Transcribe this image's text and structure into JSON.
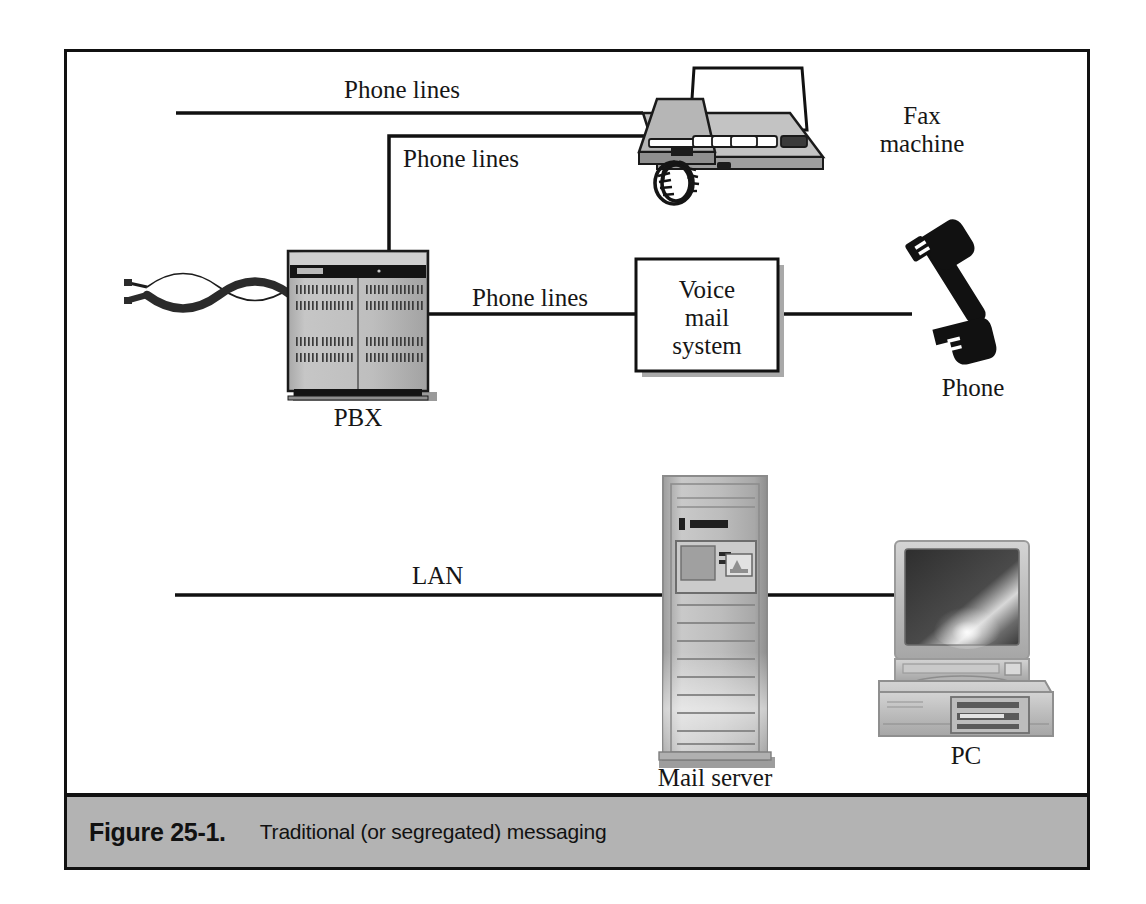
{
  "figure": {
    "number": "Figure 25-1.",
    "caption": "Traditional (or segregated) messaging",
    "bar_color": "#b3b3b3",
    "frame_color": "#111111"
  },
  "diagram": {
    "title_implicit": "Traditional (or segregated) messaging",
    "link_labels": {
      "phone_lines_top": "Phone lines",
      "phone_lines_pbx_fax": "Phone lines",
      "phone_lines_pbx_vm": "Phone lines",
      "lan": "LAN"
    },
    "nodes": [
      {
        "id": "fax",
        "label": "Fax\nmachine",
        "label_line1": "Fax",
        "label_line2": "machine",
        "icon": "fax-machine-icon"
      },
      {
        "id": "pbx",
        "label": "PBX",
        "icon": "pbx-cabinet-icon"
      },
      {
        "id": "voicemail",
        "label": "Voice mail system",
        "line1": "Voice",
        "line2": "mail",
        "line3": "system",
        "icon": "voice-mail-box"
      },
      {
        "id": "phone",
        "label": "Phone",
        "icon": "telephone-handset-icon"
      },
      {
        "id": "mailserver",
        "label": "Mail server",
        "icon": "tower-server-icon"
      },
      {
        "id": "pc",
        "label": "PC",
        "icon": "desktop-computer-icon"
      },
      {
        "id": "twistedpair",
        "label": "",
        "icon": "twisted-pair-cable-icon"
      }
    ],
    "edges": [
      {
        "from": "trunk-left",
        "to": "fax",
        "label": "Phone lines"
      },
      {
        "from": "pbx",
        "to": "fax",
        "label": "Phone lines"
      },
      {
        "from": "pbx",
        "to": "voicemail",
        "label": "Phone lines"
      },
      {
        "from": "voicemail",
        "to": "phone",
        "label": ""
      },
      {
        "from": "lan-left",
        "to": "mailserver",
        "label": "LAN"
      },
      {
        "from": "mailserver",
        "to": "pc",
        "label": ""
      },
      {
        "from": "twistedpair",
        "to": "pbx",
        "label": ""
      }
    ]
  }
}
